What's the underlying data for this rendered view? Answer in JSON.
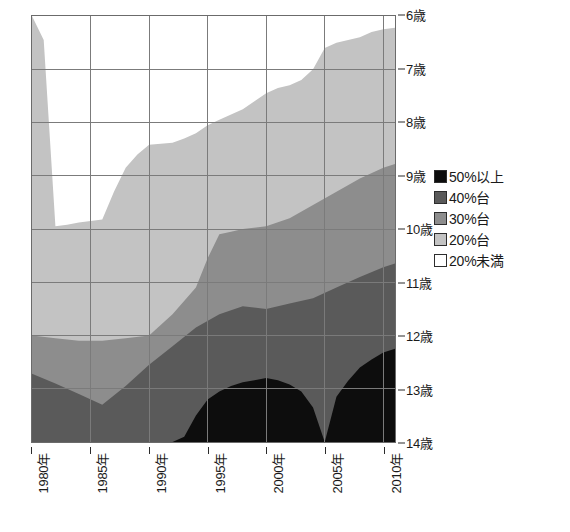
{
  "chart_data": {
    "type": "area",
    "title": "",
    "subtitle": "",
    "xlabel": "",
    "ylabel": "",
    "grid": true,
    "legend_position": "right",
    "y_axis": {
      "inverted": true,
      "ylim": [
        6,
        14
      ],
      "ticks": [
        6,
        7,
        8,
        9,
        10,
        11,
        12,
        13,
        14
      ],
      "tick_labels": [
        "6歳",
        "7歳",
        "8歳",
        "9歳",
        "10歳",
        "11歳",
        "12歳",
        "13歳",
        "14歳"
      ],
      "unit": "歳"
    },
    "x_axis": {
      "xlim": [
        1980,
        2011
      ],
      "ticks": [
        1980,
        1985,
        1990,
        1995,
        2000,
        2005,
        2010
      ],
      "tick_labels": [
        "1980年",
        "1985年",
        "1990年",
        "1995年",
        "2000年",
        "2005年",
        "2010年"
      ],
      "unit": "年",
      "label_rotation": -90
    },
    "colors": {
      "band_50_plus": "#0d0d0d",
      "band_40s": "#5a5a5a",
      "band_30s": "#8d8d8d",
      "band_20s": "#c3c3c3",
      "band_under20": "#ffffff",
      "gridline": "#7a7a7a",
      "axis": "#5e5e5e",
      "text": "#1a1a1a"
    },
    "series": [
      {
        "name": "50%以上",
        "legend": "50%以上",
        "color": "#0d0d0d",
        "boundary_description": "upper edge of the 50%-and-over band (age in years)",
        "x": [
          1980,
          1982,
          1984,
          1986,
          1988,
          1990,
          1992,
          1993,
          1994,
          1995,
          1996,
          1997,
          1998,
          1999,
          2000,
          2001,
          2002,
          2003,
          2004,
          2005,
          2006,
          2007,
          2008,
          2009,
          2010,
          2011
        ],
        "y": [
          14.0,
          14.0,
          14.0,
          14.0,
          14.0,
          14.0,
          14.0,
          13.9,
          13.5,
          13.2,
          13.05,
          12.95,
          12.88,
          12.84,
          12.8,
          12.84,
          12.92,
          13.05,
          13.35,
          14.0,
          13.15,
          12.85,
          12.6,
          12.45,
          12.32,
          12.25
        ]
      },
      {
        "name": "40%台",
        "legend": "40%台",
        "color": "#5a5a5a",
        "boundary_description": "upper edge of the 40%-range band (age in years)",
        "x": [
          1980,
          1982,
          1984,
          1986,
          1988,
          1990,
          1992,
          1994,
          1996,
          1998,
          2000,
          2002,
          2004,
          2006,
          2008,
          2010,
          2011
        ],
        "y": [
          12.72,
          12.9,
          13.1,
          13.3,
          12.95,
          12.55,
          12.2,
          11.85,
          11.6,
          11.45,
          11.5,
          11.4,
          11.3,
          11.1,
          10.9,
          10.72,
          10.65
        ]
      },
      {
        "name": "30%台",
        "legend": "30%台",
        "color": "#8d8d8d",
        "boundary_description": "upper edge of the 30%-range band (age in years)",
        "x": [
          1980,
          1982,
          1984,
          1986,
          1988,
          1990,
          1992,
          1994,
          1995,
          1996,
          1997,
          1998,
          2000,
          2002,
          2004,
          2006,
          2008,
          2010,
          2011
        ],
        "y": [
          12.0,
          12.05,
          12.1,
          12.1,
          12.05,
          12.0,
          11.6,
          11.1,
          10.55,
          10.1,
          10.05,
          10.0,
          9.95,
          9.8,
          9.55,
          9.3,
          9.05,
          8.85,
          8.78
        ]
      },
      {
        "name": "20%台",
        "legend": "20%台",
        "color": "#c3c3c3",
        "boundary_description": "upper edge of the 20%-range band (age in years)",
        "x": [
          1980,
          1981,
          1982,
          1983,
          1984,
          1985,
          1986,
          1987,
          1988,
          1989,
          1990,
          1991,
          1992,
          1993,
          1994,
          1995,
          1996,
          1997,
          1998,
          1999,
          2000,
          2001,
          2002,
          2003,
          2004,
          2005,
          2006,
          2007,
          2008,
          2009,
          2010,
          2011
        ],
        "y": [
          6.0,
          6.45,
          9.95,
          9.92,
          9.88,
          9.85,
          9.82,
          9.3,
          8.85,
          8.6,
          8.42,
          8.4,
          8.38,
          8.3,
          8.2,
          8.05,
          7.95,
          7.85,
          7.75,
          7.6,
          7.45,
          7.35,
          7.3,
          7.2,
          7.0,
          6.6,
          6.5,
          6.45,
          6.4,
          6.3,
          6.25,
          6.22
        ]
      },
      {
        "name": "20%未満",
        "legend": "20%未満",
        "color": "#ffffff",
        "boundary_description": "top of plot (6歳) — remainder above the 20%台 band",
        "x": [
          1980,
          2011
        ],
        "y": [
          6.0,
          6.0
        ]
      }
    ]
  },
  "legend": {
    "items": [
      {
        "label": "50%以上",
        "color": "#0d0d0d"
      },
      {
        "label": "40%台",
        "color": "#5a5a5a"
      },
      {
        "label": "30%台",
        "color": "#8d8d8d"
      },
      {
        "label": "20%台",
        "color": "#c3c3c3"
      },
      {
        "label": "20%未満",
        "color": "#ffffff"
      }
    ]
  }
}
